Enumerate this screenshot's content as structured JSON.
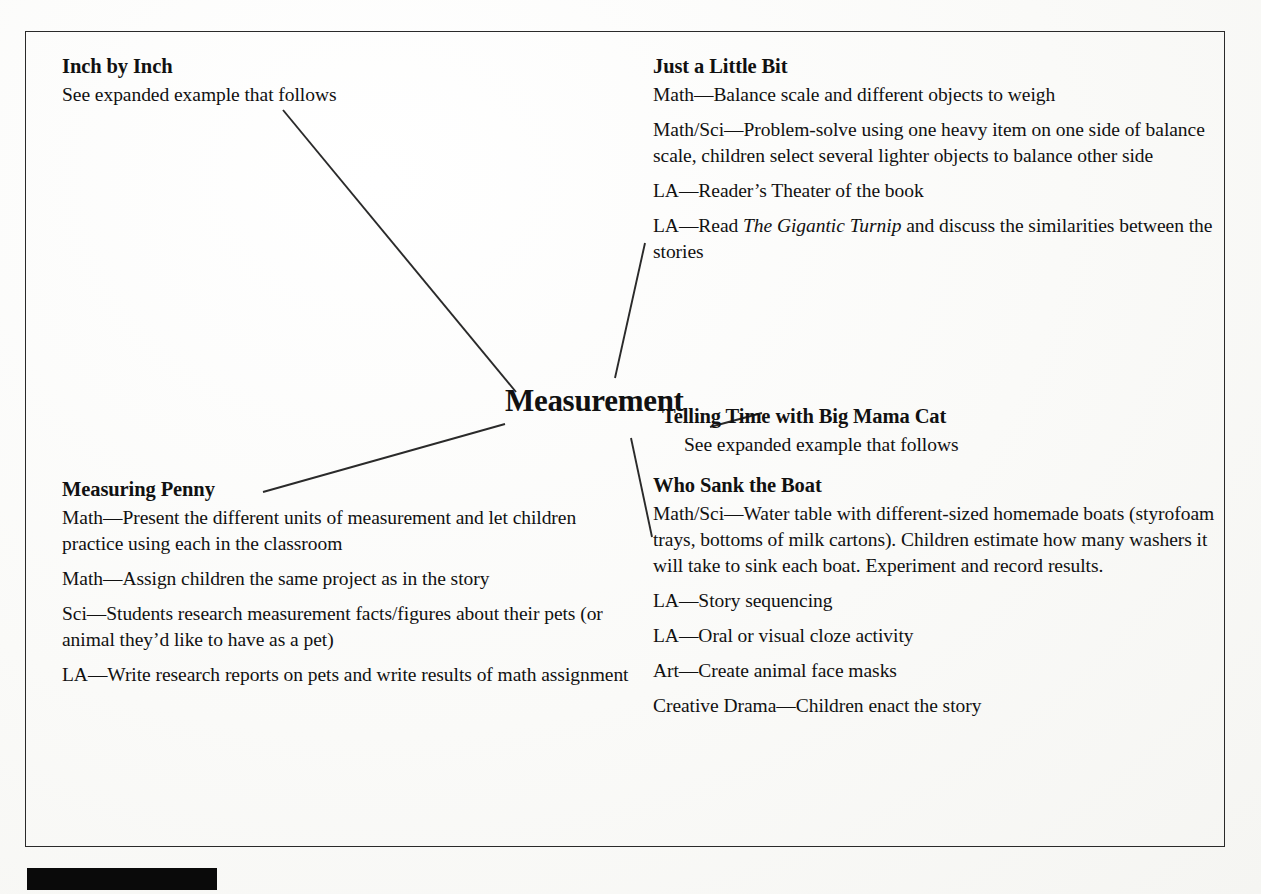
{
  "diagram": {
    "type": "web-cluster-map",
    "center": {
      "label": "Measurement"
    },
    "branches": [
      {
        "id": "inch-by-inch",
        "title": "Inch by Inch",
        "lines": [
          {
            "text": "See expanded example that follows"
          }
        ]
      },
      {
        "id": "just-a-little-bit",
        "title": "Just a Little Bit",
        "lines": [
          {
            "text": "Math—Balance scale and different objects to weigh"
          },
          {
            "text": "Math/Sci—Problem-solve using one heavy item on one side of balance scale, children select several lighter objects to balance  other side"
          },
          {
            "text": "LA—Reader’s Theater of the book"
          },
          {
            "pre": "LA—Read ",
            "italic": "The Gigantic Turnip",
            "post": " and discuss the similarities between the stories"
          }
        ]
      },
      {
        "id": "telling-time-with-big-mama-cat",
        "title": "Telling Time with Big Mama Cat",
        "lines": [
          {
            "text": "See expanded example that follows"
          }
        ]
      },
      {
        "id": "measuring-penny",
        "title": "Measuring Penny",
        "lines": [
          {
            "text": "Math—Present the different units of measurement and let children practice using each in the classroom"
          },
          {
            "text": "Math—Assign children the same project as in the story"
          },
          {
            "text": "Sci—Students research measurement facts/figures about their pets (or animal they’d like to have as a pet)"
          },
          {
            "text": "LA—Write research reports on pets and write results of math assignment"
          }
        ]
      },
      {
        "id": "who-sank-the-boat",
        "title": "Who Sank the Boat",
        "lines": [
          {
            "text": "Math/Sci—Water table with different-sized homemade boats (styrofoam trays, bottoms of milk cartons). Children estimate how many washers it will take to  sink each boat. Experiment and record results."
          },
          {
            "text": "LA—Story sequencing"
          },
          {
            "text": "LA—Oral or visual cloze activity"
          },
          {
            "text": "Art—Create animal face masks"
          },
          {
            "text": "Creative Drama—Children enact the story"
          }
        ]
      }
    ],
    "colors": {
      "ink": "#111111",
      "rule": "#2a2a2a",
      "page": "#fbfbfa",
      "redaction": "#0a0a0a"
    }
  }
}
